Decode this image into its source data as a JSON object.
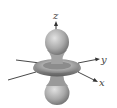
{
  "diagram": {
    "type": "orbital",
    "axes": {
      "z": {
        "label": "z"
      },
      "y": {
        "label": "y"
      },
      "x": {
        "label": "x"
      }
    },
    "colors": {
      "lobe_light": "#d4d4d4",
      "lobe_dark": "#6e6e6e",
      "axis": "#333333",
      "background": "#ffffff"
    }
  }
}
